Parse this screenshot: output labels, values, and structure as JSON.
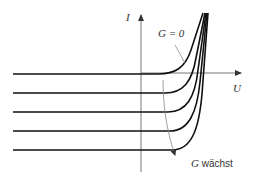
{
  "diagram": {
    "type": "I-U characteristic curves (solar cell)",
    "axes": {
      "y_label": "I",
      "x_label": "U"
    },
    "annotations": {
      "dark_curve_label": "G = 0",
      "arrow_label_var": "G",
      "arrow_label_text": " wächst"
    },
    "curves": [
      {
        "name": "G = 0",
        "level_y": 74
      },
      {
        "name": "G1",
        "level_y": 93
      },
      {
        "name": "G2",
        "level_y": 112
      },
      {
        "name": "G3",
        "level_y": 131
      },
      {
        "name": "G4",
        "level_y": 150
      }
    ],
    "colors": {
      "curve": "#111111",
      "axis": "#777777",
      "annotation": "#888888"
    }
  }
}
